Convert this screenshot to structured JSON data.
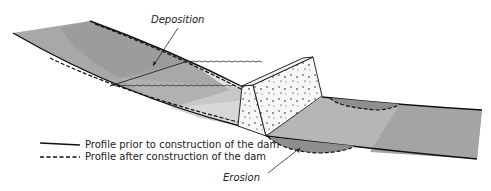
{
  "diagram": {
    "labels": {
      "deposition": "Deposition",
      "erosion": "Erosion"
    },
    "legend": [
      {
        "style": "solid",
        "label": "Profile prior to construction of the dam"
      },
      {
        "style": "dashed",
        "label": "Profile after construction of the dam"
      }
    ],
    "colors": {
      "channel_dark": "#9a9a9a",
      "channel_mid": "#b4b4b4",
      "channel_light": "#d6d6d6",
      "reservoir": "#e6e6e6",
      "dam_fill": "#f7f7f7",
      "line": "#1a1a1a"
    }
  }
}
